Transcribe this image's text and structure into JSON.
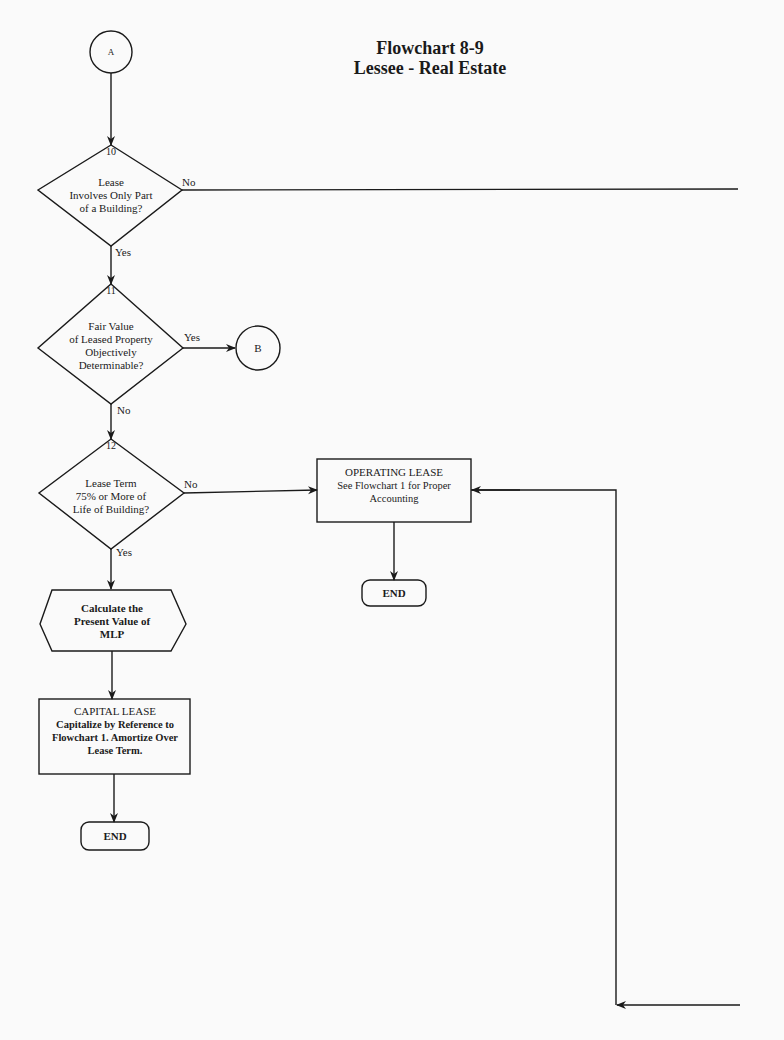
{
  "title": {
    "line1": "Flowchart 8-9",
    "line2": "Lessee - Real Estate"
  },
  "connectors": {
    "entry": "A",
    "exit": "B"
  },
  "decisions": [
    {
      "number": "10",
      "lines": [
        "Lease",
        "Involves Only Part",
        "of a Building?"
      ],
      "yes": "Yes",
      "no": "No"
    },
    {
      "number": "11",
      "lines": [
        "Fair Value",
        "of Leased Property",
        "Objectively",
        "Determinable?"
      ],
      "yes": "Yes",
      "no": "No"
    },
    {
      "number": "12",
      "lines": [
        "Lease Term",
        "75% or More of",
        "Life of Building?"
      ],
      "yes": "Yes",
      "no": "No"
    }
  ],
  "process": {
    "lines": [
      "Calculate the",
      "Present Value of",
      "MLP"
    ]
  },
  "capital_lease": {
    "heading": "CAPITAL LEASE",
    "lines": [
      "Capitalize by Reference to",
      "Flowchart 1. Amortize Over",
      "Lease Term."
    ]
  },
  "operating_lease": {
    "heading": "OPERATING LEASE",
    "lines": [
      "See Flowchart 1 for Proper",
      "Accounting"
    ]
  },
  "end_labels": {
    "left": "END",
    "middle": "END"
  }
}
